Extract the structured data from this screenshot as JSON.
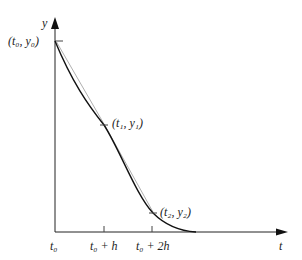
{
  "diagram": {
    "axes": {
      "x_label": "t",
      "y_label": "y"
    },
    "x_ticks": [
      {
        "label": "t₀",
        "pos": "t0"
      },
      {
        "label": "t₀ + h",
        "pos": "t0+h"
      },
      {
        "label": "t₀ + 2h",
        "pos": "t0+2h"
      }
    ],
    "points": [
      {
        "label": "(t₀, y₀)"
      },
      {
        "label": "(t₁, y₁)"
      },
      {
        "label": "(t₂, y₂)"
      }
    ],
    "curves": [
      {
        "name": "exact-solution",
        "style": "solid",
        "color": "#111111"
      },
      {
        "name": "euler-polygon",
        "style": "thin-gray",
        "color": "#9a9a9a"
      }
    ]
  }
}
